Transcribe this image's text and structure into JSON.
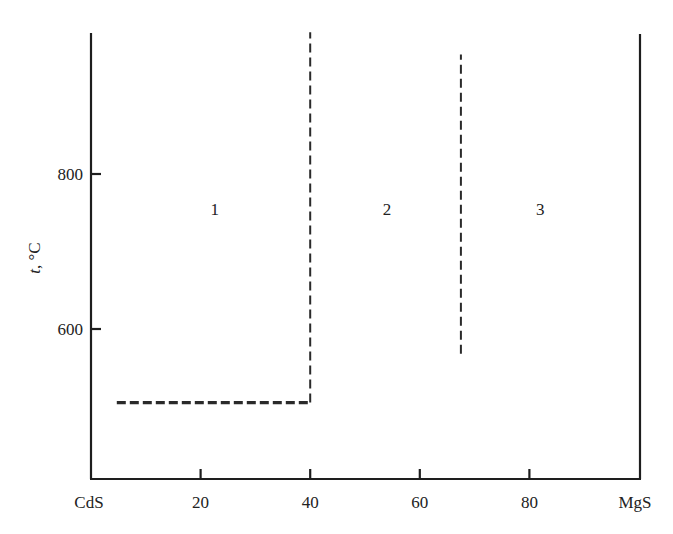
{
  "chart_data": {
    "type": "line",
    "title": "",
    "subtitle": "",
    "xlabel": "",
    "ylabel_parts": {
      "var": "t",
      "sep": ", ",
      "unit": "°C"
    },
    "ylabel": "t, °C",
    "x_axis": {
      "left_end_label": "CdS",
      "right_end_label": "MgS",
      "range": [
        0,
        100
      ],
      "ticks": [
        20,
        40,
        60,
        80
      ],
      "tick_labels": [
        "20",
        "40",
        "60",
        "80"
      ],
      "units": "mol% MgS (implied)"
    },
    "y_axis": {
      "range": [
        405,
        985
      ],
      "ticks": [
        600,
        800
      ],
      "tick_labels": [
        "600",
        "800"
      ]
    },
    "grid": false,
    "legend": null,
    "series": [
      {
        "name": "boundary-horizontal",
        "style": "dashed-thick",
        "points": [
          [
            4.7,
            505
          ],
          [
            40,
            505
          ]
        ]
      },
      {
        "name": "boundary-vertical-40",
        "style": "dashed",
        "points": [
          [
            40,
            505
          ],
          [
            40,
            983
          ]
        ]
      },
      {
        "name": "boundary-vertical-67",
        "style": "dashed",
        "points": [
          [
            67.5,
            568
          ],
          [
            67.5,
            954
          ]
        ]
      }
    ],
    "annotations": [
      {
        "text": "1",
        "x": 22.6,
        "y": 755
      },
      {
        "text": "2",
        "x": 54.0,
        "y": 755
      },
      {
        "text": "3",
        "x": 82.0,
        "y": 755
      }
    ]
  },
  "layout": {
    "plot_left_px": 91,
    "plot_right_px": 640,
    "plot_top_px": 33,
    "plot_bottom_px": 479,
    "y_ref_value": 800,
    "y_ref_px": 174,
    "px_per_degree": 0.775,
    "px_per_percent": 5.48
  },
  "colors": {
    "axis": "#1e1e1e",
    "line": "#2a2a2a",
    "text": "#222222",
    "background": "#ffffff"
  }
}
